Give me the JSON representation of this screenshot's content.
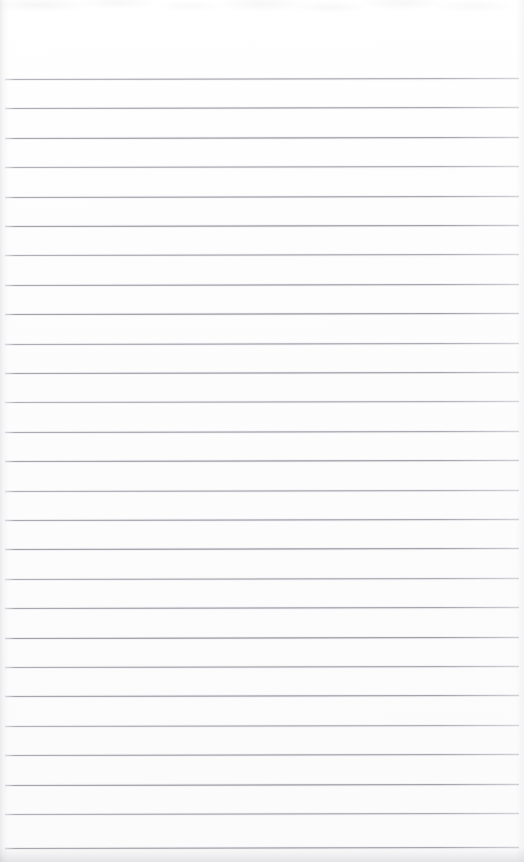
{
  "document": {
    "kind": "scanned-page",
    "title": "Blank ruled notepad page",
    "paper_color": "#fdfdfd",
    "rule_color": "#80808a",
    "width_px": 524,
    "height_px": 862,
    "content_text": "",
    "handwriting_present": "no",
    "printed_text_present": "no"
  },
  "ruling": {
    "line_count": 27,
    "first_line_y": 79,
    "line_spacing_px": 29.4,
    "line_thickness_px": 1,
    "left_margin_px": 5,
    "right_margin_px": 5,
    "line_width_px": 514,
    "skew_deg": -0.12,
    "lines_y": [
      79,
      108.4,
      137.8,
      167.2,
      196.6,
      226,
      255.4,
      284.8,
      314.2,
      343.6,
      373,
      402.4,
      431.8,
      461.2,
      490.6,
      520,
      549.4,
      578.8,
      608.2,
      637.6,
      667,
      696.4,
      725.8,
      755.2,
      784.6,
      814,
      848
    ]
  },
  "scan_artifacts": {
    "top_mottling": "faint",
    "left_edge_streak": "faint light vertical band",
    "right_edge_falloff": "very faint",
    "bottom_shadow_band": "grey gradient below last rule",
    "bottom_band_height_px": 15
  }
}
